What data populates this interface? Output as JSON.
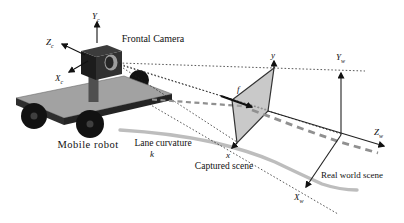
{
  "figure": {
    "labels": {
      "frontal_camera": "Frontal Camera",
      "mobile_robot": "Mobile robot",
      "lane_curvature": "Lane curvature",
      "lane_k": "k",
      "captured_scene": "Captured scene",
      "real_world_scene": "Real world scene"
    },
    "axes": {
      "camera": {
        "y": {
          "main": "Y",
          "sub": "c"
        },
        "z": {
          "main": "Z",
          "sub": "c"
        },
        "x": {
          "main": "X",
          "sub": "c"
        }
      },
      "image_plane": {
        "y": "y",
        "x": "x",
        "focal": "f"
      },
      "world": {
        "y": {
          "main": "Y",
          "sub": "w"
        },
        "z": {
          "main": "Z",
          "sub": "w"
        },
        "x": {
          "main": "X",
          "sub": "w"
        }
      }
    },
    "colors": {
      "background": "#ffffff",
      "platform_top": "#a2a2a2",
      "platform_front": "#2e2e2e",
      "platform_side": "#242424",
      "wheel": "#121212",
      "wheel_hub": "#3f3f3f",
      "pole": "#4f4f4f",
      "camera_top": "#3c3c3c",
      "camera_front": "#1c1c1c",
      "camera_side": "#303030",
      "lens_outer": "#9d9d9d",
      "lens_inner": "#262626",
      "plane_fill": "#a8a8a8",
      "plane_edge": "#333333",
      "lane": "#bdbdbd",
      "lane_dash": "#909090",
      "line": "#1a1a1a"
    }
  }
}
